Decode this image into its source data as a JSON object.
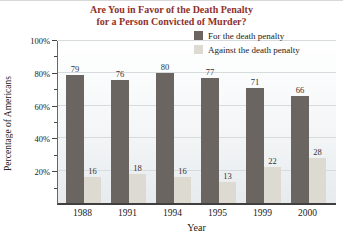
{
  "chart_data": {
    "type": "bar",
    "title_line1": "Are You in Favor of the Death Penalty",
    "title_line2": "for a Person Convicted of Murder?",
    "title_color": "#8e322d",
    "categories": [
      "1988",
      "1991",
      "1994",
      "1995",
      "1999",
      "2000"
    ],
    "series": [
      {
        "name": "For the death penalty",
        "color": "#6b6561",
        "values": [
          79,
          76,
          80,
          77,
          71,
          66
        ]
      },
      {
        "name": "Against the death penalty",
        "color": "#dcdad1",
        "values": [
          16,
          18,
          16,
          13,
          22,
          28
        ]
      }
    ],
    "xlabel": "Year",
    "ylabel": "Percentage of Americans",
    "ylim": [
      0,
      100
    ],
    "yticks": [
      20,
      40,
      60,
      80,
      100
    ],
    "ytick_suffix": "%",
    "minor_tick_step": 10,
    "grid": true,
    "legend_position": "top-right",
    "value_labels": true
  }
}
